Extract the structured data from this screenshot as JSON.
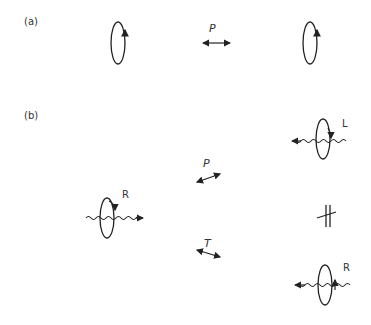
{
  "panels": {
    "a": {
      "label": "(a)",
      "operator": "P",
      "left_loop": "circulation loop, arrow upward on right side",
      "right_loop": "circulation loop, arrow upward on right side"
    },
    "b": {
      "label": "(b)",
      "left_particle": {
        "helicity": "R",
        "direction": "right"
      },
      "top_particle": {
        "helicity": "L",
        "direction": "left"
      },
      "bottom_particle": {
        "helicity": "R",
        "direction": "left"
      },
      "operator_top": "P",
      "operator_bottom": "T",
      "not_equal_symbol": "#"
    }
  }
}
